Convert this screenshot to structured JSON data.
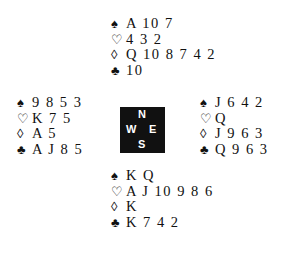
{
  "hands": {
    "north": {
      "spades": "A 10 7",
      "hearts": "4 3 2",
      "diamonds": "Q 10 8 7 4 2",
      "clubs": "10"
    },
    "west": {
      "spades": "9 8 5 3",
      "hearts": "K 7 5",
      "diamonds": "A 5",
      "clubs": "A J 8 5"
    },
    "east": {
      "spades": "J 6 4 2",
      "hearts": "Q",
      "diamonds": "J 9 6 3",
      "clubs": "Q 9 6 3"
    },
    "south": {
      "spades": "K Q",
      "hearts": "A J 10 9 8 6",
      "diamonds": "K",
      "clubs": "K 7 4 2"
    }
  },
  "suits": {
    "spades": "♠",
    "hearts": "♡",
    "diamonds": "◊",
    "clubs": "♣"
  },
  "compass": {
    "n": "N",
    "w": "W",
    "e": "E",
    "s": "S"
  }
}
